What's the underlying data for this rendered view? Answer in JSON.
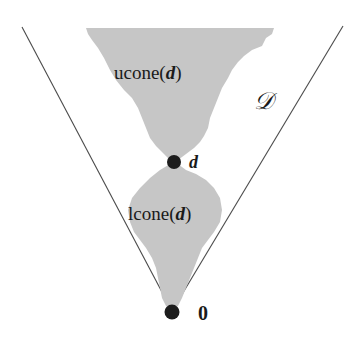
{
  "diagram": {
    "cone_label": "𝒟",
    "upper_region": {
      "prefix": "ucone(",
      "var": "d",
      "suffix": ")"
    },
    "lower_region": {
      "prefix": "lcone(",
      "var": "d",
      "suffix": ")"
    },
    "point_d": {
      "label": "d"
    },
    "point_origin": {
      "label": "0"
    },
    "colors": {
      "region_fill": "#c6c6c6",
      "line": "#4a4a4a",
      "point": "#1c1c1c"
    }
  }
}
